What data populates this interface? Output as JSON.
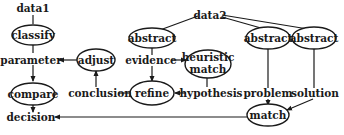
{
  "diagram": {
    "nodes": {
      "data1": "data1",
      "classify": "classify",
      "parameter": "parameter",
      "adjust": "adjust",
      "compare": "compare",
      "conclusion": "conclusion",
      "decision": "decision",
      "data2": "data2",
      "abstract1": "abstract",
      "abstract2": "abstract",
      "abstract3": "abstract",
      "evidence": "evidence",
      "heuristic_match_line1": "heuristic",
      "heuristic_match_line2": "match",
      "refine": "refine",
      "hypothesis": "hypothesis",
      "problem": "problem",
      "solution": "solution",
      "match": "match"
    },
    "edges": [
      {
        "from": "data1",
        "to": "classify",
        "arrow": false
      },
      {
        "from": "classify",
        "to": "parameter",
        "arrow": false
      },
      {
        "from": "adjust",
        "to": "parameter",
        "arrow": true
      },
      {
        "from": "parameter",
        "to": "compare",
        "arrow": true
      },
      {
        "from": "compare",
        "to": "decision",
        "arrow": true
      },
      {
        "from": "conclusion",
        "to": "adjust",
        "arrow": true
      },
      {
        "from": "refine",
        "to": "conclusion",
        "arrow": false
      },
      {
        "from": "data2",
        "to": "abstract1",
        "arrow": false
      },
      {
        "from": "data2",
        "to": "abstract2",
        "arrow": false
      },
      {
        "from": "data2",
        "to": "abstract3",
        "arrow": false
      },
      {
        "from": "abstract1",
        "to": "evidence",
        "arrow": false
      },
      {
        "from": "evidence",
        "to": "heuristic match",
        "arrow": true
      },
      {
        "from": "evidence",
        "to": "refine",
        "arrow": true
      },
      {
        "from": "heuristic match",
        "to": "hypothesis",
        "arrow": false
      },
      {
        "from": "hypothesis",
        "to": "refine",
        "arrow": true
      },
      {
        "from": "abstract2",
        "to": "problem",
        "arrow": false
      },
      {
        "from": "problem",
        "to": "match",
        "arrow": true
      },
      {
        "from": "abstract3",
        "to": "solution",
        "arrow": false
      },
      {
        "from": "solution",
        "to": "match",
        "arrow": true
      },
      {
        "from": "match",
        "to": "decision",
        "arrow": true
      }
    ]
  }
}
